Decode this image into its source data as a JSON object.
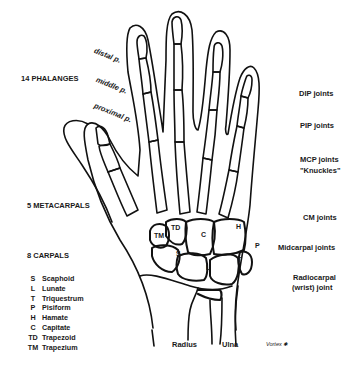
{
  "diagram": {
    "left_labels": {
      "phalanges": "14 PHALANGES",
      "metacarpals": "5  METACARPALS",
      "carpals": "8 CARPALS"
    },
    "phalanx_labels": {
      "distal": "distal p.",
      "middle": "middle p.",
      "proximal": "proximal p."
    },
    "carpal_legend": [
      {
        "abbr": "S",
        "name": "Scaphoid"
      },
      {
        "abbr": "L",
        "name": "Lunate"
      },
      {
        "abbr": "T",
        "name": "Triquestrum"
      },
      {
        "abbr": "P",
        "name": "Pisiform"
      },
      {
        "abbr": "H",
        "name": "Hamate"
      },
      {
        "abbr": "C",
        "name": "Capitate"
      },
      {
        "abbr": "TD",
        "name": "Trapezoid"
      },
      {
        "abbr": "TM",
        "name": "Trapezium"
      }
    ],
    "carpal_bone_tags": {
      "tm": "TM",
      "td": "TD",
      "c": "C",
      "h": "H",
      "s": "S",
      "l": "L",
      "t": "T",
      "p": "P"
    },
    "joint_labels": {
      "dip": "DIP joints",
      "pip": "PIP joints",
      "mcp_line1": "MCP joints",
      "mcp_line2": "\"Knuckles\"",
      "cm": "CM joints",
      "midcarpal": "Midcarpal joints",
      "radiocarpal_line1": "Radiocarpal",
      "radiocarpal_line2": "(wrist) joint"
    },
    "forearm_labels": {
      "radius": "Radius",
      "ulna": "Ulna"
    },
    "signature": "Vortex ✱"
  }
}
